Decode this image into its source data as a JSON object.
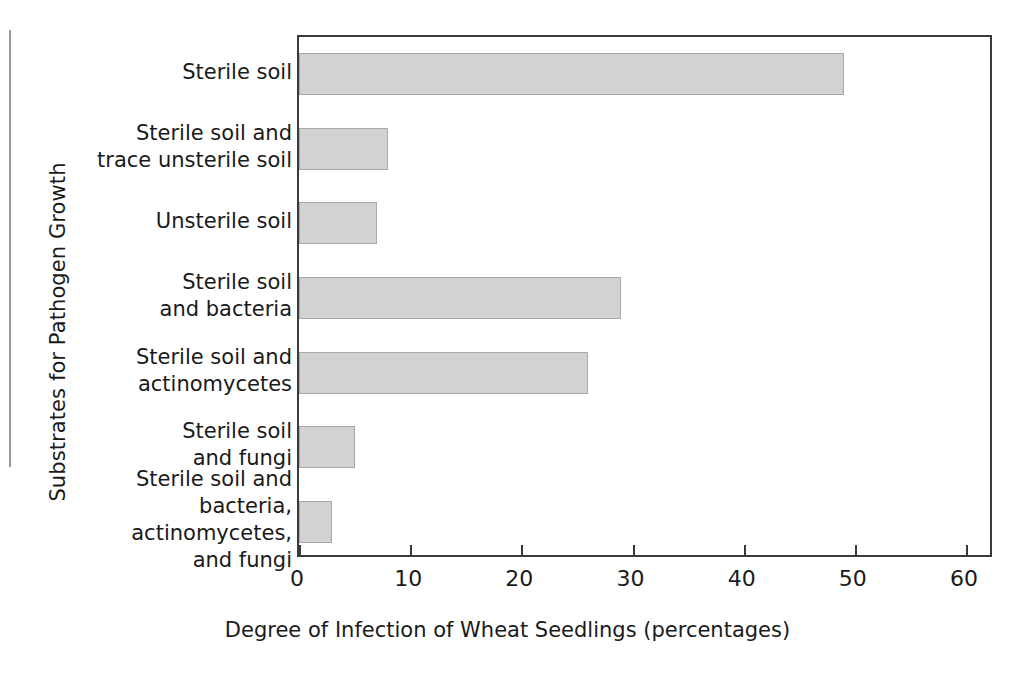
{
  "chart_data": {
    "type": "bar",
    "orientation": "horizontal",
    "title": "",
    "xlabel": "Degree of Infection of Wheat Seedlings (percentages)",
    "ylabel": "Substrates for Pathogen Growth",
    "categories": [
      "Sterile soil",
      "Sterile soil and\ntrace unsterile soil",
      "Unsterile soil",
      "Sterile soil\nand bacteria",
      "Sterile soil and\nactinomycetes",
      "Sterile soil\nand fungi",
      "Sterile soil and\nbacteria,\nactinomycetes,\nand fungi"
    ],
    "category_lines": [
      [
        "Sterile soil"
      ],
      [
        "Sterile soil and",
        "trace unsterile soil"
      ],
      [
        "Unsterile soil"
      ],
      [
        "Sterile soil",
        "and bacteria"
      ],
      [
        "Sterile soil and",
        "actinomycetes"
      ],
      [
        "Sterile soil",
        "and fungi"
      ],
      [
        "Sterile soil and",
        "bacteria,",
        "actinomycetes,",
        "and fungi"
      ]
    ],
    "values": [
      49,
      8,
      7,
      29,
      26,
      5,
      3
    ],
    "xlim": [
      0,
      60
    ],
    "xticks": [
      0,
      10,
      20,
      30,
      40,
      50,
      60
    ],
    "xtick_labels": [
      "0",
      "10",
      "20",
      "30",
      "40",
      "50",
      "60"
    ],
    "grid": false,
    "legend": null,
    "bar_fill_color": "#d2d2d2",
    "bar_edge_color": "#a9a9a9",
    "axis_color": "#3a3a3a"
  }
}
